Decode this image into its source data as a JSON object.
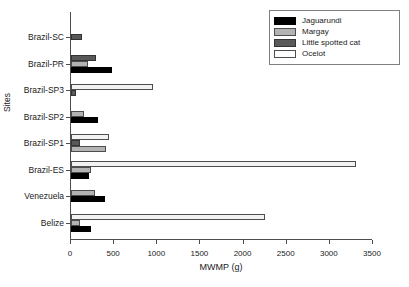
{
  "chart_data": {
    "type": "bar",
    "orientation": "horizontal",
    "title": "",
    "xlabel": "MWMP (g)",
    "ylabel": "Sites",
    "xlim": [
      0,
      3500
    ],
    "xticks": [
      0,
      500,
      1000,
      1500,
      2000,
      2500,
      3000,
      3500
    ],
    "xtick_labels": [
      "0",
      "500",
      "1000",
      "1500",
      "2000",
      "2500",
      "3000",
      "3500"
    ],
    "grid": false,
    "legend_position": "top-right",
    "categories": [
      "Brazil-SC",
      "Brazil-PR",
      "Brazil-SP3",
      "Brazil-SP2",
      "Brazil-SP1",
      "Brazil-ES",
      "Venezuela",
      "Belize"
    ],
    "series": [
      {
        "name": "Jaguarundi",
        "color": "#000000",
        "values": [
          null,
          470,
          null,
          310,
          null,
          210,
          390,
          230
        ]
      },
      {
        "name": "Margay",
        "color": "#b3b3b3",
        "values": [
          null,
          200,
          null,
          150,
          400,
          230,
          280,
          100
        ]
      },
      {
        "name": "Little spotted cat",
        "color": "#595959",
        "values": [
          130,
          285,
          55,
          null,
          110,
          null,
          null,
          null
        ]
      },
      {
        "name": "Ocelot",
        "color": "#ffffff",
        "values": [
          null,
          null,
          950,
          null,
          440,
          3300,
          null,
          2250
        ]
      }
    ]
  },
  "legend": {
    "entries": [
      {
        "label": "Jaguarundi",
        "swatch": "jaguarundi"
      },
      {
        "label": "Margay",
        "swatch": "margay"
      },
      {
        "label": "Little spotted cat",
        "swatch": "littlespotted"
      },
      {
        "label": "Ocelot",
        "swatch": "ocelot"
      }
    ]
  }
}
